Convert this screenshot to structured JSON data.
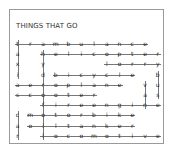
{
  "puzzle": {
    "title": "THINGS THAT GO",
    "rows": [
      [
        "t",
        "r",
        "a",
        "m",
        "b",
        "u",
        "l",
        "a",
        "n",
        "c",
        "e",
        ""
      ],
      [
        "a",
        "",
        "h",
        "e",
        "l",
        "i",
        "c",
        "o",
        "p",
        "t",
        "e",
        "r"
      ],
      [
        "x",
        "",
        "y",
        "",
        "",
        "",
        "",
        "l",
        "o",
        "r",
        "r",
        "y"
      ],
      [
        "i",
        "",
        "d",
        "b",
        "i",
        "c",
        "y",
        "c",
        "l",
        "e",
        "",
        "b"
      ],
      [
        "a",
        "e",
        "r",
        "o",
        "p",
        "l",
        "a",
        "n",
        "e",
        "",
        "v",
        "u"
      ],
      [
        "s",
        "c",
        "o",
        "o",
        "t",
        "e",
        "r",
        "",
        "",
        "",
        "a",
        "s"
      ],
      [
        "",
        "",
        "f",
        "i",
        "r",
        "e",
        "e",
        "n",
        "g",
        "i",
        "n",
        "e"
      ],
      [
        "c",
        "m",
        "o",
        "t",
        "o",
        "r",
        "b",
        "i",
        "k",
        "e",
        "",
        ""
      ],
      [
        "a",
        "o",
        "i",
        "l",
        "t",
        "a",
        "n",
        "k",
        "e",
        "r",
        "",
        ""
      ],
      [
        "r",
        "",
        "l",
        "o",
        "c",
        "o",
        "m",
        "o",
        "t",
        "i",
        "v",
        "e"
      ]
    ],
    "found_words": [
      {
        "word": "tram",
        "dir": "h",
        "row": 0,
        "start": 0,
        "end": 3
      },
      {
        "word": "ambulance",
        "dir": "h",
        "row": 0,
        "start": 2,
        "end": 10
      },
      {
        "word": "helicopter",
        "dir": "h",
        "row": 1,
        "start": 2,
        "end": 11
      },
      {
        "word": "lorry",
        "dir": "h",
        "row": 2,
        "start": 7,
        "end": 11
      },
      {
        "word": "bicycle",
        "dir": "h",
        "row": 3,
        "start": 3,
        "end": 9
      },
      {
        "word": "aeroplane",
        "dir": "h",
        "row": 4,
        "start": 0,
        "end": 8
      },
      {
        "word": "scooter",
        "dir": "h",
        "row": 5,
        "start": 0,
        "end": 6
      },
      {
        "word": "fireengine",
        "dir": "h",
        "row": 6,
        "start": 2,
        "end": 11
      },
      {
        "word": "motorbike",
        "dir": "h",
        "row": 7,
        "start": 1,
        "end": 9
      },
      {
        "word": "oiltanker",
        "dir": "h",
        "row": 8,
        "start": 1,
        "end": 9
      },
      {
        "word": "locomotive",
        "dir": "h",
        "row": 9,
        "start": 2,
        "end": 11
      },
      {
        "word": "taxi",
        "dir": "v",
        "col": 0,
        "start": 0,
        "end": 3
      },
      {
        "word": "car",
        "dir": "v",
        "col": 0,
        "start": 7,
        "end": 9
      },
      {
        "word": "hydrofoil",
        "dir": "v",
        "col": 2,
        "start": 1,
        "end": 9
      },
      {
        "word": "van",
        "dir": "v",
        "col": 10,
        "start": 4,
        "end": 6
      },
      {
        "word": "bus",
        "dir": "v",
        "col": 11,
        "start": 3,
        "end": 5
      }
    ],
    "colors": {
      "text": "#222222",
      "line": "#777777",
      "border": "#9a9a9a"
    }
  }
}
